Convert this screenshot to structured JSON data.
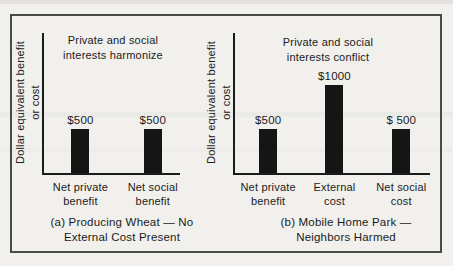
{
  "figure": {
    "bg_color": "#f1f0ed",
    "frame_color": "#4a4a4a",
    "bar_color": "#151515",
    "ink_color": "#1b1b1b"
  },
  "chart_data": [
    {
      "type": "bar",
      "title": "Private and social\ninterests harmonize",
      "ylabel": "Dollar equivalent benefit\nor cost",
      "xlabel": "",
      "caption": "(a) Producing Wheat — No\nExternal Cost Present",
      "categories": [
        "Net private\nbenefit",
        "Net social\nbenefit"
      ],
      "values": [
        500,
        500
      ],
      "value_labels": [
        "$500",
        "$500"
      ],
      "ylim": [
        0,
        1600
      ],
      "grid": false,
      "legend": false,
      "x_fractions": [
        0.268,
        0.8
      ]
    },
    {
      "type": "bar",
      "title": "Private and social\ninterests conflict",
      "ylabel": "Dollar equivalent benefit\nor cost",
      "xlabel": "",
      "caption": "(b) Mobile Home Park —\nNeighbors Harmed",
      "categories": [
        "Net private\nbenefit",
        "External\ncost",
        "Net social\ncost"
      ],
      "values": [
        500,
        1000,
        500
      ],
      "value_labels": [
        "$500",
        "$1000",
        "$ 500"
      ],
      "ylim": [
        0,
        1600
      ],
      "grid": false,
      "legend": false,
      "x_fractions": [
        0.17,
        0.51,
        0.853
      ]
    }
  ]
}
